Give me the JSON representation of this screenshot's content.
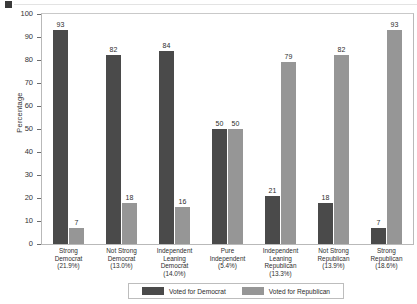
{
  "chart_data": {
    "type": "bar",
    "title": "",
    "xlabel": "",
    "ylabel": "Percentage",
    "ylim": [
      0,
      100
    ],
    "yticks": [
      0,
      10,
      20,
      30,
      40,
      50,
      60,
      70,
      80,
      90,
      100
    ],
    "grid": false,
    "legend_position": "bottom",
    "categories": [
      "Strong Democrat (21.9%)",
      "Not Strong Democrat (13.0%)",
      "Independent Leaning Democrat (14.0%)",
      "Pure Independent (5.4%)",
      "Independent Leaning Republican (13.3%)",
      "Not Strong Republican (13.9%)",
      "Strong Republican (18.6%)"
    ],
    "category_lines": [
      [
        "Strong",
        "Democrat",
        "(21.9%)"
      ],
      [
        "Not Strong",
        "Democrat",
        "(13.0%)"
      ],
      [
        "Independent",
        "Leaning",
        "Democrat",
        "(14.0%)"
      ],
      [
        "Pure",
        "Independent",
        "(5.4%)"
      ],
      [
        "Independent",
        "Leaning",
        "Republican",
        "(13.3%)"
      ],
      [
        "Not Strong",
        "Republican",
        "(13.9%)"
      ],
      [
        "Strong",
        "Republican",
        "(18.6%)"
      ]
    ],
    "series": [
      {
        "name": "Voted for Democrat",
        "color": "#4a4a4a",
        "values": [
          93,
          82,
          84,
          50,
          21,
          18,
          7
        ]
      },
      {
        "name": "Voted for Republican",
        "color": "#969696",
        "values": [
          7,
          18,
          16,
          50,
          79,
          82,
          93
        ]
      }
    ]
  },
  "legend": {
    "entries": [
      {
        "label": "Voted for Democrat"
      },
      {
        "label": "Voted for Republican"
      }
    ]
  }
}
